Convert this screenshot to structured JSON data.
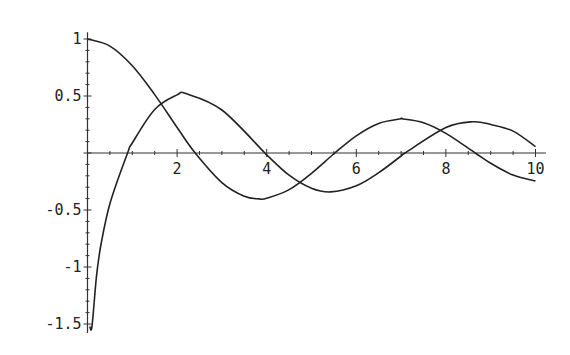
{
  "chart_data": {
    "type": "line",
    "title": "",
    "xlabel": "",
    "ylabel": "",
    "xlim": [
      0,
      10
    ],
    "ylim": [
      -1.6,
      1.05
    ],
    "grid": false,
    "legend": null,
    "x_ticks": [
      {
        "value": 2,
        "label": "2"
      },
      {
        "value": 4,
        "label": "4"
      },
      {
        "value": 6,
        "label": "6"
      },
      {
        "value": 8,
        "label": "8"
      },
      {
        "value": 10,
        "label": "10"
      }
    ],
    "y_ticks": [
      {
        "value": 1,
        "label": "1"
      },
      {
        "value": 0.5,
        "label": "0.5"
      },
      {
        "value": -0.5,
        "label": "-0.5"
      },
      {
        "value": -1,
        "label": "-1"
      },
      {
        "value": -1.5,
        "label": "-1.5"
      }
    ],
    "series": [
      {
        "name": "J0(x)",
        "x": [
          0,
          0.5,
          1,
          1.5,
          2,
          2.405,
          3,
          3.5,
          3.832,
          4,
          4.5,
          5,
          5.52,
          6,
          6.5,
          7,
          7.016,
          7.5,
          8,
          8.654,
          9,
          9.5,
          10
        ],
        "values": [
          1,
          0.938,
          0.765,
          0.512,
          0.224,
          0,
          -0.26,
          -0.38,
          -0.403,
          -0.397,
          -0.321,
          -0.178,
          0,
          0.151,
          0.26,
          0.3,
          0.3,
          0.266,
          0.172,
          0,
          -0.09,
          -0.194,
          -0.246
        ]
      },
      {
        "name": "Y0(x)",
        "x": [
          0.05,
          0.1,
          0.2,
          0.3,
          0.5,
          0.894,
          1,
          1.5,
          2,
          2.197,
          3,
          3.958,
          4,
          4.5,
          5,
          5.43,
          6,
          6.5,
          7,
          7.086,
          8,
          8.596,
          9,
          9.5,
          10
        ],
        "values": [
          -1.979,
          -1.534,
          -1.081,
          -0.807,
          -0.445,
          0,
          0.088,
          0.382,
          0.51,
          0.521,
          0.377,
          0,
          -0.017,
          -0.195,
          -0.309,
          -0.341,
          -0.288,
          -0.173,
          -0.026,
          0,
          0.223,
          0.274,
          0.25,
          0.192,
          0.056
        ]
      }
    ],
    "colors": {
      "line": "#222222",
      "axis": "#333333"
    }
  }
}
